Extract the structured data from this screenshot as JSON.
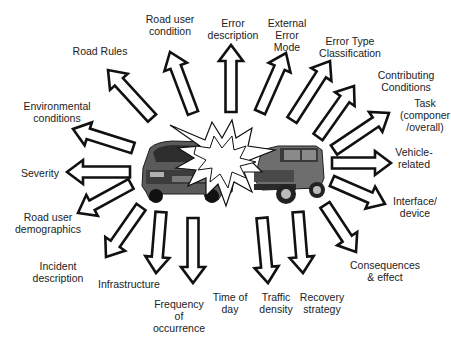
{
  "diagram": {
    "type": "radial-arrow-diagram",
    "center": "crash",
    "center_parts": [
      "car-left",
      "collision-starburst",
      "jeep-right"
    ],
    "arrow_color": "#111111",
    "arrow_fill": "#ffffff",
    "labels": [
      {
        "id": "road-rules",
        "text": "Road Rules",
        "x": 100,
        "y": 45
      },
      {
        "id": "road-user-condition",
        "text": "Road user\ncondition",
        "x": 170,
        "y": 13
      },
      {
        "id": "error-description",
        "text": "Error\ndescription",
        "x": 233,
        "y": 17
      },
      {
        "id": "external-error-mode",
        "text": "External\nError\nMode",
        "x": 287,
        "y": 17
      },
      {
        "id": "error-type-classification",
        "text": "Error Type\nClassification",
        "x": 350,
        "y": 35
      },
      {
        "id": "contributing-conditions",
        "text": "Contributing\nConditions",
        "x": 406,
        "y": 69
      },
      {
        "id": "task",
        "text": "Task\n(componer\n/overall)",
        "x": 425,
        "y": 97
      },
      {
        "id": "vehicle-related",
        "text": "Vehicle-\nrelated",
        "x": 414,
        "y": 146
      },
      {
        "id": "interface-device",
        "text": "Interface/\ndevice",
        "x": 415,
        "y": 195
      },
      {
        "id": "environmental-conditions",
        "text": "Environmental\nconditions",
        "x": 57,
        "y": 100
      },
      {
        "id": "severity",
        "text": "Severity",
        "x": 40,
        "y": 167
      },
      {
        "id": "road-user-demographics",
        "text": "Road user\ndemographics",
        "x": 48,
        "y": 211
      },
      {
        "id": "incident-description",
        "text": "Incident\ndescription",
        "x": 58,
        "y": 260
      },
      {
        "id": "infrastructure",
        "text": "Infrastructure",
        "x": 129,
        "y": 278
      },
      {
        "id": "frequency-of-occurrence",
        "text": "Frequency\nof\noccurrence",
        "x": 179,
        "y": 298
      },
      {
        "id": "time-of-day",
        "text": "Time of\nday",
        "x": 230,
        "y": 291
      },
      {
        "id": "traffic-density",
        "text": "Traffic\ndensity",
        "x": 276,
        "y": 291
      },
      {
        "id": "recovery-strategy",
        "text": "Recovery\nstrategy",
        "x": 322,
        "y": 291
      },
      {
        "id": "consequences-effect",
        "text": "Consequences\n& effect",
        "x": 385,
        "y": 259
      }
    ],
    "arrows": [
      {
        "id": "road-rules",
        "tail": [
          152,
          118
        ],
        "tip": [
          108,
          70
        ]
      },
      {
        "id": "road-user-condition",
        "tail": [
          193,
          113
        ],
        "tip": [
          170,
          52
        ]
      },
      {
        "id": "error-description",
        "tail": [
          231,
          112
        ],
        "tip": [
          231,
          45
        ]
      },
      {
        "id": "external-error-mode",
        "tail": [
          260,
          112
        ],
        "tip": [
          286,
          53
        ]
      },
      {
        "id": "error-type-classification",
        "tail": [
          292,
          120
        ],
        "tip": [
          330,
          61
        ]
      },
      {
        "id": "contributing-conditions",
        "tail": [
          318,
          137
        ],
        "tip": [
          354,
          86
        ]
      },
      {
        "id": "task",
        "tail": [
          334,
          150
        ],
        "tip": [
          389,
          113
        ]
      },
      {
        "id": "vehicle-related",
        "tail": [
          332,
          163
        ],
        "tip": [
          391,
          163
        ]
      },
      {
        "id": "interface-device",
        "tail": [
          332,
          181
        ],
        "tip": [
          385,
          204
        ]
      },
      {
        "id": "environmental-conditions",
        "tail": [
          133,
          148
        ],
        "tip": [
          73,
          129
        ]
      },
      {
        "id": "severity",
        "tail": [
          130,
          172
        ],
        "tip": [
          67,
          172
        ]
      },
      {
        "id": "road-user-demographics",
        "tail": [
          131,
          184
        ],
        "tip": [
          78,
          213
        ]
      },
      {
        "id": "infrastructure",
        "tail": [
          141,
          207
        ],
        "tip": [
          106,
          257
        ]
      },
      {
        "id": "frequency-of-occurrence",
        "tail": [
          161,
          212
        ],
        "tip": [
          156,
          273
        ]
      },
      {
        "id": "time-of-day",
        "tail": [
          193,
          218
        ],
        "tip": [
          193,
          283
        ]
      },
      {
        "id": "traffic-density",
        "tail": [
          262,
          218
        ],
        "tip": [
          268,
          283
        ]
      },
      {
        "id": "recovery-strategy",
        "tail": [
          298,
          212
        ],
        "tip": [
          303,
          273
        ]
      },
      {
        "id": "consequences-effect",
        "tail": [
          325,
          205
        ],
        "tip": [
          356,
          252
        ]
      }
    ]
  }
}
